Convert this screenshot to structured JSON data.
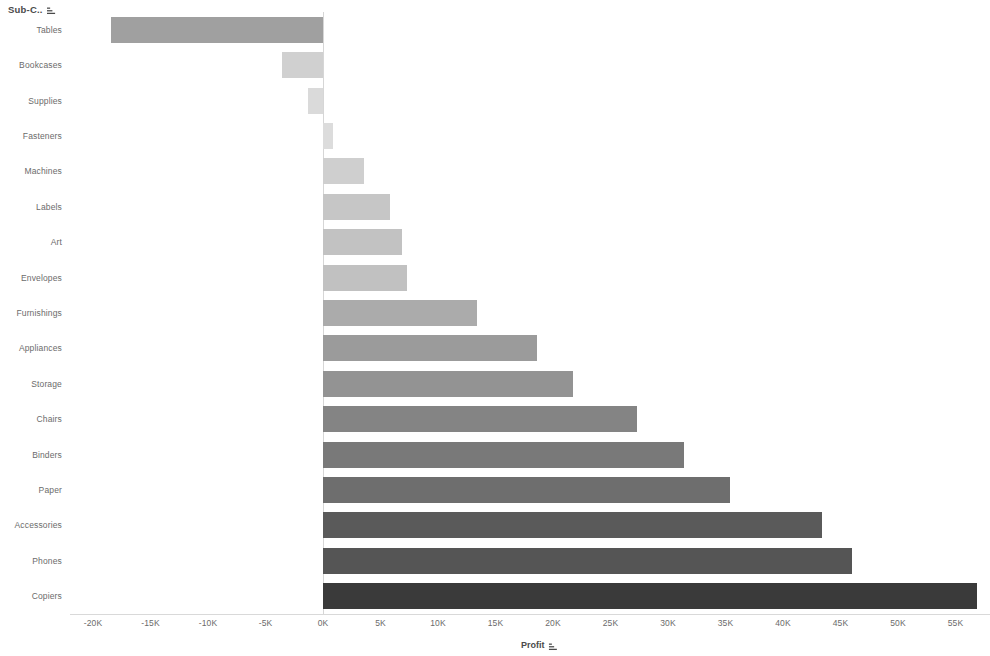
{
  "row_header": {
    "label": "Sub-C..",
    "sort_icon": "sort-ascending-icon"
  },
  "axis": {
    "x_title": "Profit",
    "x_sort_icon": "sort-ascending-icon",
    "x_ticks": [
      "-20K",
      "-15K",
      "-10K",
      "-5K",
      "0K",
      "5K",
      "10K",
      "15K",
      "20K",
      "25K",
      "30K",
      "35K",
      "40K",
      "45K",
      "50K",
      "55K"
    ],
    "x_tick_values": [
      -20000,
      -15000,
      -10000,
      -5000,
      0,
      5000,
      10000,
      15000,
      20000,
      25000,
      30000,
      35000,
      40000,
      45000,
      50000,
      55000
    ]
  },
  "colors": {
    "background": "#ffffff",
    "axis_text": "#6b6b6b",
    "title_text": "#4a4a4a",
    "zero_line": "#d6d6d6",
    "bar_min": "#d9d9d9",
    "bar_max": "#3a3a3a"
  },
  "chart_data": {
    "type": "bar",
    "orientation": "horizontal",
    "title": "",
    "subtitle": "",
    "xlabel": "Profit",
    "ylabel": "Sub-C..",
    "xlim": [
      -22000,
      58000
    ],
    "grid": false,
    "legend": null,
    "categories": [
      "Tables",
      "Bookcases",
      "Supplies",
      "Fasteners",
      "Machines",
      "Labels",
      "Art",
      "Envelopes",
      "Furnishings",
      "Appliances",
      "Storage",
      "Chairs",
      "Binders",
      "Paper",
      "Accessories",
      "Phones",
      "Copiers"
    ],
    "values": [
      -18400,
      -3600,
      -1300,
      900,
      3600,
      5800,
      6900,
      7300,
      13400,
      18600,
      21700,
      27300,
      31400,
      35400,
      43400,
      46000,
      56900
    ],
    "bar_colors": [
      "#a0a0a0",
      "#d0d0d0",
      "#dadada",
      "#dcdcdc",
      "#cfcfcf",
      "#c6c6c6",
      "#c2c2c2",
      "#c1c1c1",
      "#ababab",
      "#9b9b9b",
      "#939393",
      "#848484",
      "#797979",
      "#6e6e6e",
      "#5a5a5a",
      "#555555",
      "#3a3a3a"
    ]
  }
}
